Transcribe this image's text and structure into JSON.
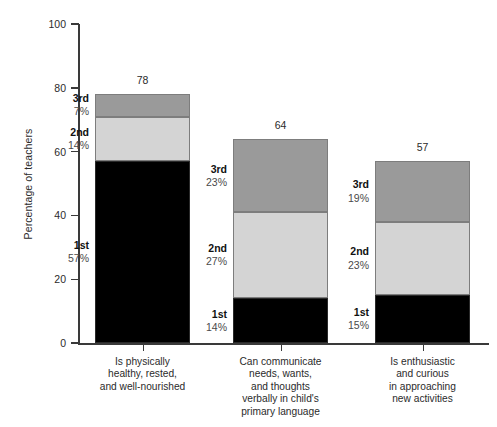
{
  "chart_data": {
    "type": "bar",
    "title": "",
    "subtitle": "",
    "xlabel": "",
    "ylabel": "Percentage of teachers",
    "ylim": [
      0,
      100
    ],
    "yticks": [
      0,
      20,
      40,
      60,
      80,
      100
    ],
    "ytick_labels": [
      "0",
      "20",
      "40",
      "60",
      "80",
      "100"
    ],
    "grid": false,
    "legend": "none",
    "stacked": true,
    "series": [
      {
        "name": "1st",
        "values": [
          57,
          14,
          15
        ]
      },
      {
        "name": "2nd",
        "values": [
          14,
          27,
          23
        ]
      },
      {
        "name": "3rd",
        "values": [
          7,
          23,
          19
        ]
      }
    ],
    "categories": [
      "Is physically\nhealthy, rested,\nand well-nourished",
      "Can communicate\nneeds, wants,\nand thoughts\nverbally in child's\nprimary language",
      "Is enthusiastic\nand curious\nin approaching\nnew activities"
    ],
    "totals": [
      78,
      64,
      57
    ],
    "colors": {
      "first": "#000000",
      "second": "#d4d4d4",
      "third": "#9a9a9a",
      "axis": "#3a3a3a",
      "text": "#2b2b2b",
      "pct_text": "#4a4a4a",
      "background": "#ffffff"
    }
  },
  "axis": {
    "y_title": "Percentage of teachers",
    "ticks": [
      {
        "label": "100",
        "value": 100
      },
      {
        "label": "80",
        "value": 80
      },
      {
        "label": "60",
        "value": 60
      },
      {
        "label": "40",
        "value": 40
      },
      {
        "label": "20",
        "value": 20
      },
      {
        "label": "0",
        "value": 0
      }
    ]
  },
  "bars": [
    {
      "total_label": "78",
      "category_lines": [
        "Is physically",
        "healthy, rested,",
        "and well-nourished"
      ],
      "segments": [
        {
          "rank": "3rd",
          "pct": "7%",
          "value": 7
        },
        {
          "rank": "2nd",
          "pct": "14%",
          "value": 14
        },
        {
          "rank": "1st",
          "pct": "57%",
          "value": 57
        }
      ]
    },
    {
      "total_label": "64",
      "category_lines": [
        "Can communicate",
        "needs, wants,",
        "and thoughts",
        "verbally in child's",
        "primary language"
      ],
      "segments": [
        {
          "rank": "3rd",
          "pct": "23%",
          "value": 23
        },
        {
          "rank": "2nd",
          "pct": "27%",
          "value": 27
        },
        {
          "rank": "1st",
          "pct": "14%",
          "value": 14
        }
      ]
    },
    {
      "total_label": "57",
      "category_lines": [
        "Is enthusiastic",
        "and curious",
        "in approaching",
        "new activities"
      ],
      "segments": [
        {
          "rank": "3rd",
          "pct": "19%",
          "value": 19
        },
        {
          "rank": "2nd",
          "pct": "23%",
          "value": 23
        },
        {
          "rank": "1st",
          "pct": "15%",
          "value": 15
        }
      ]
    }
  ]
}
